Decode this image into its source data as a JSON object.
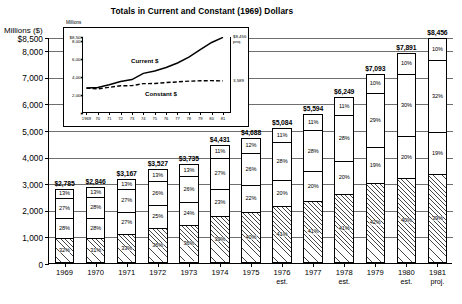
{
  "main": {
    "title": "Totals in Current and Constant (1969) Dollars",
    "y_axis_title": "Millions ($)"
  },
  "chart_data": [
    {
      "type": "bar",
      "title": "Totals in Current and Constant (1969) Dollars",
      "subtype": "stacked-bar-percent",
      "xlabel": "",
      "ylabel": "Millions ($)",
      "ylim": [
        0,
        8500
      ],
      "grid": true,
      "legend_position": "right",
      "ytick_labels": [
        "$8,500",
        "8,000",
        "7,000",
        "6,000",
        "5,000",
        "4,000",
        "3,000",
        "2,000",
        "1,000",
        "0"
      ],
      "ytick_values": [
        8500,
        8000,
        7000,
        6000,
        5000,
        4000,
        3000,
        2000,
        1000,
        0
      ],
      "categories": [
        "1969",
        "1970",
        "1971",
        "1972",
        "1973",
        "1974",
        "1975",
        "1976",
        "1977",
        "1978",
        "1979",
        "1980",
        "1981"
      ],
      "category_sublabels": [
        "",
        "",
        "",
        "",
        "",
        "",
        "",
        "est.",
        "",
        "est.",
        "",
        "est.",
        "proj."
      ],
      "totals": [
        2785,
        2846,
        3167,
        3527,
        3735,
        4431,
        4688,
        5084,
        5594,
        6249,
        7093,
        7891,
        8456
      ],
      "total_labels": [
        "$2,785",
        "$2,846",
        "$3,167",
        "$3,527",
        "$3,735",
        "$4,431",
        "$4,688",
        "$5,084",
        "$5,594",
        "$6,249",
        "$7,093",
        "$7,891",
        "$8,456"
      ],
      "series": [
        {
          "name": "Other",
          "order": 0,
          "fill": "white",
          "values": [
            13,
            13,
            13,
            13,
            13,
            11,
            12,
            11,
            11,
            11,
            10,
            10,
            10
          ],
          "labels": [
            "13%",
            "13%",
            "13%",
            "13%",
            "13%",
            "11%",
            "12%",
            "11%",
            "11%",
            "11%",
            "10%",
            "10%",
            "10%"
          ]
        },
        {
          "name": "Industry",
          "order": 1,
          "fill": "white",
          "values": [
            27,
            28,
            27,
            26,
            26,
            27,
            26,
            28,
            28,
            28,
            29,
            30,
            32
          ],
          "labels": [
            "27%",
            "28%",
            "27%",
            "26%",
            "26%",
            "27%",
            "26%",
            "28%",
            "28%",
            "28%",
            "29%",
            "30%",
            "32%"
          ]
        },
        {
          "name": "Other Federal",
          "order": 2,
          "fill": "white",
          "values": [
            28,
            28,
            27,
            25,
            24,
            23,
            22,
            20,
            20,
            20,
            19,
            20,
            19
          ],
          "labels": [
            "28%",
            "28%",
            "27%",
            "25%",
            "24%",
            "23%",
            "22%",
            "20%",
            "20%",
            "20%",
            "19%",
            "20%",
            "19%"
          ]
        },
        {
          "name": "NIH",
          "order": 3,
          "fill": "hatch",
          "values": [
            32,
            31,
            33,
            36,
            36,
            39,
            40,
            41,
            41,
            41,
            42,
            40,
            39
          ],
          "labels": [
            "32%",
            "31%",
            "33%",
            "36%",
            "36%",
            "39%",
            "40%",
            "41%",
            "41%",
            "41%",
            "42%",
            "40%",
            "39%"
          ]
        }
      ],
      "category_labels_right": [
        "Other",
        "Industry",
        "Other Federal",
        "NIH"
      ]
    },
    {
      "type": "line",
      "title": "",
      "ylabel": "Millions",
      "xlabel": "",
      "ylim": [
        0,
        8500
      ],
      "grid": false,
      "legend_position": "inline",
      "ytick_labels": [
        "$8,500",
        "8,000",
        "6,000",
        "4,000",
        "2,000",
        "0"
      ],
      "ytick_values": [
        8500,
        8000,
        6000,
        4000,
        2000,
        0
      ],
      "x": [
        "1969",
        "70",
        "71",
        "72",
        "73",
        "74",
        "75",
        "76",
        "77",
        "78",
        "79",
        "80",
        "81"
      ],
      "series": [
        {
          "name": "Current $",
          "style": "solid",
          "values": [
            2785,
            2846,
            3167,
            3527,
            3735,
            4431,
            4688,
            5084,
            5594,
            6249,
            7093,
            7891,
            8456
          ],
          "end_label": "$8,456",
          "end_label_sub": "proj."
        },
        {
          "name": "Constant $",
          "style": "dashed",
          "values": [
            2785,
            2700,
            2870,
            3050,
            3060,
            3280,
            3300,
            3400,
            3480,
            3560,
            3600,
            3620,
            3589
          ],
          "end_label": "3,589",
          "end_label_sub": ""
        }
      ]
    }
  ]
}
